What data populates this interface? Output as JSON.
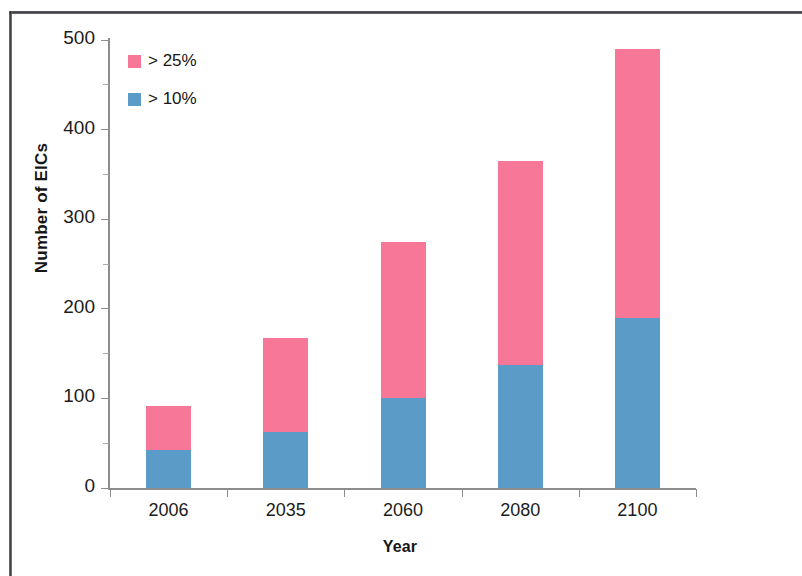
{
  "chart_data": {
    "type": "bar",
    "subtype": "stacked",
    "title": "",
    "xlabel": "Year",
    "ylabel": "Number of EICs",
    "categories": [
      "2006",
      "2035",
      "2060",
      "2080",
      "2100"
    ],
    "series": [
      {
        "name": "> 10%",
        "color": "#5b9bc8",
        "values": [
          42,
          62,
          100,
          137,
          190
        ]
      },
      {
        "name": "> 25%",
        "color": "#f77799",
        "values": [
          50,
          105,
          175,
          228,
          300
        ]
      }
    ],
    "totals": [
      92,
      167,
      275,
      365,
      490
    ],
    "ylim": [
      0,
      500
    ],
    "yticks": [
      0,
      100,
      200,
      300,
      400,
      500
    ],
    "yticks_minor": [
      50,
      150,
      250,
      350,
      450
    ],
    "ytick_labels": [
      "0",
      "100",
      "200",
      "300",
      "400",
      "500"
    ],
    "grid": false,
    "legend_position": "upper-left-inside",
    "legend": [
      {
        "label": "> 25%",
        "color": "#f77799"
      },
      {
        "label": "> 10%",
        "color": "#5b9bc8"
      }
    ]
  },
  "figure": {
    "frame_color": "#2e2c30",
    "axis_color": "#8d8d8d",
    "background": "#ffffff"
  }
}
